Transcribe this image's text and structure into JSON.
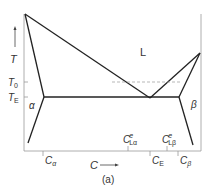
{
  "figure": {
    "caption": "(a)",
    "phase_labels": {
      "liquid": "L",
      "alpha": "α",
      "beta": "β"
    },
    "y_axis": {
      "label": "T",
      "ticks": [
        {
          "main": "T",
          "sub": "0"
        },
        {
          "main": "T",
          "sub": "E"
        }
      ]
    },
    "x_axis": {
      "label": "C",
      "ticks_below": [
        {
          "main": "C",
          "sub": "α"
        },
        {
          "main": "C",
          "sub": "E"
        },
        {
          "main": "C",
          "sub": "β"
        }
      ],
      "ticks_above": [
        {
          "main": "C",
          "sup": "e",
          "sub": "Lα"
        },
        {
          "main": "C",
          "sup": "e",
          "sub": "Lβ"
        }
      ]
    },
    "colors": {
      "line": "#222222",
      "axis": "#888888",
      "dashed": "#999999"
    }
  }
}
